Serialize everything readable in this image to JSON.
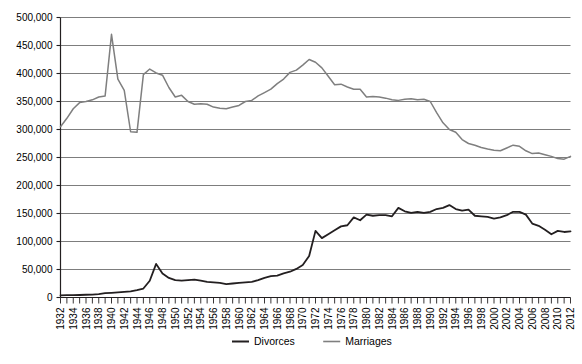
{
  "chart_data": {
    "type": "line",
    "title": "",
    "subtitle": "",
    "xlabel": "",
    "ylabel": "",
    "xlim": [
      1932,
      2012
    ],
    "ylim": [
      0,
      500000
    ],
    "grid": true,
    "grid_axis": "y",
    "legend_position": "bottom",
    "y_ticks": [
      0,
      50000,
      100000,
      150000,
      200000,
      250000,
      300000,
      350000,
      400000,
      450000,
      500000
    ],
    "y_tick_labels": [
      "0",
      "50,000",
      "100,000",
      "150,000",
      "200,000",
      "250,000",
      "300,000",
      "350,000",
      "400,000",
      "450,000",
      "500,000"
    ],
    "x_tick_labels": [
      "1932",
      "1934",
      "1936",
      "1938",
      "1940",
      "1942",
      "1944",
      "1946",
      "1948",
      "1950",
      "1952",
      "1954",
      "1956",
      "1958",
      "1960",
      "1962",
      "1964",
      "1966",
      "1968",
      "1970",
      "1972",
      "1974",
      "1976",
      "1978",
      "1980",
      "1982",
      "1984",
      "1986",
      "1988",
      "1990",
      "1992",
      "1994",
      "1996",
      "1998",
      "2000",
      "2002",
      "2004",
      "2006",
      "2008",
      "2010",
      "2012"
    ],
    "x_minor_ticks_every_year": true,
    "x": [
      1932,
      1933,
      1934,
      1935,
      1936,
      1937,
      1938,
      1939,
      1940,
      1941,
      1942,
      1943,
      1944,
      1945,
      1946,
      1947,
      1948,
      1949,
      1950,
      1951,
      1952,
      1953,
      1954,
      1955,
      1956,
      1957,
      1958,
      1959,
      1960,
      1961,
      1962,
      1963,
      1964,
      1965,
      1966,
      1967,
      1968,
      1969,
      1970,
      1971,
      1972,
      1973,
      1974,
      1975,
      1976,
      1977,
      1978,
      1979,
      1980,
      1981,
      1982,
      1983,
      1984,
      1985,
      1986,
      1987,
      1988,
      1989,
      1990,
      1991,
      1992,
      1993,
      1994,
      1995,
      1996,
      1997,
      1998,
      1999,
      2000,
      2001,
      2002,
      2003,
      2004,
      2005,
      2006,
      2007,
      2008,
      2009,
      2010,
      2011,
      2012
    ],
    "series": [
      {
        "name": "Divorces",
        "color": "#231f20",
        "width": 1.8,
        "values": [
          3900,
          4100,
          4300,
          4500,
          4900,
          5200,
          6100,
          7700,
          8400,
          9100,
          10000,
          11000,
          13000,
          16000,
          30000,
          60000,
          43000,
          35000,
          31000,
          30000,
          31000,
          32000,
          30000,
          28000,
          27000,
          26000,
          24000,
          25000,
          26000,
          27000,
          28000,
          31000,
          35000,
          38000,
          39000,
          43000,
          46000,
          51000,
          58000,
          74000,
          119000,
          106000,
          113000,
          120000,
          127000,
          129000,
          143000,
          138000,
          148000,
          146000,
          147000,
          147000,
          145000,
          160000,
          154000,
          151000,
          153000,
          151000,
          153000,
          158000,
          160000,
          165000,
          158000,
          155000,
          157000,
          146000,
          145000,
          144000,
          141000,
          143000,
          147000,
          153000,
          153000,
          148000,
          132000,
          128000,
          121000,
          113000,
          119000,
          117000,
          118000
        ]
      },
      {
        "name": "Marriages",
        "color": "#7f7f7f",
        "width": 1.5,
        "values": [
          305000,
          320000,
          337000,
          348000,
          350000,
          353000,
          358000,
          360000,
          470000,
          390000,
          370000,
          296000,
          295000,
          398000,
          408000,
          401000,
          397000,
          375000,
          358000,
          361000,
          350000,
          345000,
          346000,
          345000,
          340000,
          338000,
          337000,
          340000,
          343000,
          350000,
          352000,
          360000,
          366000,
          372000,
          382000,
          390000,
          402000,
          406000,
          415000,
          425000,
          420000,
          410000,
          395000,
          380000,
          381000,
          376000,
          372000,
          372000,
          358000,
          359000,
          358000,
          356000,
          353000,
          352000,
          354000,
          355000,
          353000,
          354000,
          350000,
          330000,
          312000,
          300000,
          295000,
          282000,
          275000,
          272000,
          268000,
          265000,
          263000,
          262000,
          267000,
          272000,
          270000,
          262000,
          257000,
          258000,
          255000,
          252000,
          248000,
          247000,
          252000
        ]
      }
    ]
  },
  "legend": {
    "items": [
      {
        "label": "Divorces",
        "color": "#231f20"
      },
      {
        "label": "Marriages",
        "color": "#7f7f7f"
      }
    ]
  }
}
